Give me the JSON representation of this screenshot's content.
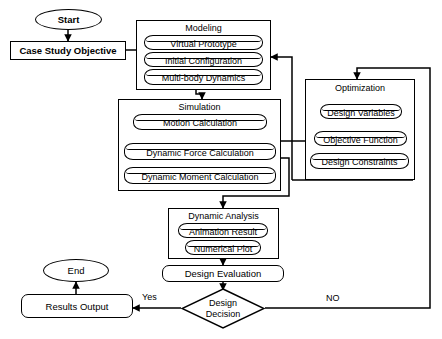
{
  "diagram": {
    "background_color": "#ffffff",
    "line_color": "#000000"
  },
  "nodes": {
    "start": {
      "label": "Start",
      "shape": "ellipse"
    },
    "case_study_objective": {
      "label": "Case Study Objective",
      "shape": "rectangle"
    },
    "design_evaluation": {
      "label": "Design Evaluation",
      "shape": "rounded-rectangle"
    },
    "results_output": {
      "label": "Results Output",
      "shape": "rounded-rectangle"
    },
    "end": {
      "label": "End",
      "shape": "ellipse"
    },
    "design_decision": {
      "label_line1": "Design",
      "label_line2": "Decision",
      "shape": "diamond"
    }
  },
  "groups": {
    "modeling": {
      "title": "Modeling",
      "items": [
        {
          "label": "Virtual Prototype"
        },
        {
          "label": "Initial Configuration"
        },
        {
          "label": "Multi-body Dynamics"
        }
      ]
    },
    "simulation": {
      "title": "Simulation",
      "items": [
        {
          "label": "Motion Calculation"
        },
        {
          "label": "Dynamic Force Calculation"
        },
        {
          "label": "Dynamic Moment Calculation"
        }
      ]
    },
    "optimization": {
      "title": "Optimization",
      "items": [
        {
          "label": "Design Variables"
        },
        {
          "label": "Objective Function"
        },
        {
          "label": "Design Constraints"
        }
      ]
    },
    "dynamic_analysis": {
      "title": "Dynamic Analysis",
      "items": [
        {
          "label": "Animation Result"
        },
        {
          "label": "Numerical Plot"
        }
      ]
    }
  },
  "edge_labels": {
    "yes": "Yes",
    "no": "NO"
  }
}
